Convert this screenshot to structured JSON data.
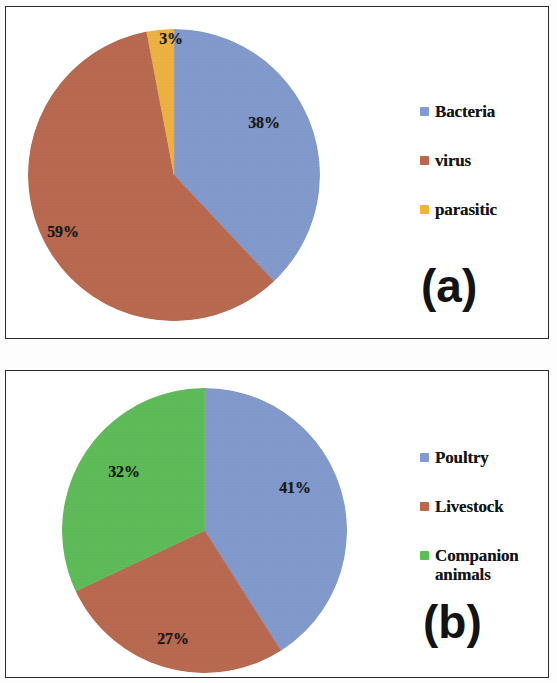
{
  "figure": {
    "background_color": "#ffffff",
    "border_color": "#2b2b2b"
  },
  "palette": {
    "blue": "#7f9ad4",
    "red": "#c0674a",
    "orange": "#f5b333",
    "green": "#57c050"
  },
  "panels": [
    {
      "tag": "(a)",
      "chart_data": {
        "type": "pie",
        "title": "",
        "categories": [
          "Bacteria",
          "virus",
          "parasitic"
        ],
        "values": [
          38,
          59,
          3
        ],
        "value_labels": [
          "38%",
          "59%",
          "3%"
        ],
        "colors": [
          "#7f9ad4",
          "#c0674a",
          "#f5b333"
        ],
        "units": "percent",
        "start_angle_deg": 0,
        "direction": "clockwise",
        "legend_position": "right",
        "grid": false
      }
    },
    {
      "tag": "(b)",
      "chart_data": {
        "type": "pie",
        "title": "",
        "categories": [
          "Poultry",
          "Livestock",
          "Companion animals"
        ],
        "values": [
          41,
          27,
          32
        ],
        "value_labels": [
          "41%",
          "27%",
          "32%"
        ],
        "colors": [
          "#7f9ad4",
          "#c0674a",
          "#57c050"
        ],
        "units": "percent",
        "start_angle_deg": 0,
        "direction": "clockwise",
        "legend_position": "right",
        "grid": false
      }
    }
  ]
}
